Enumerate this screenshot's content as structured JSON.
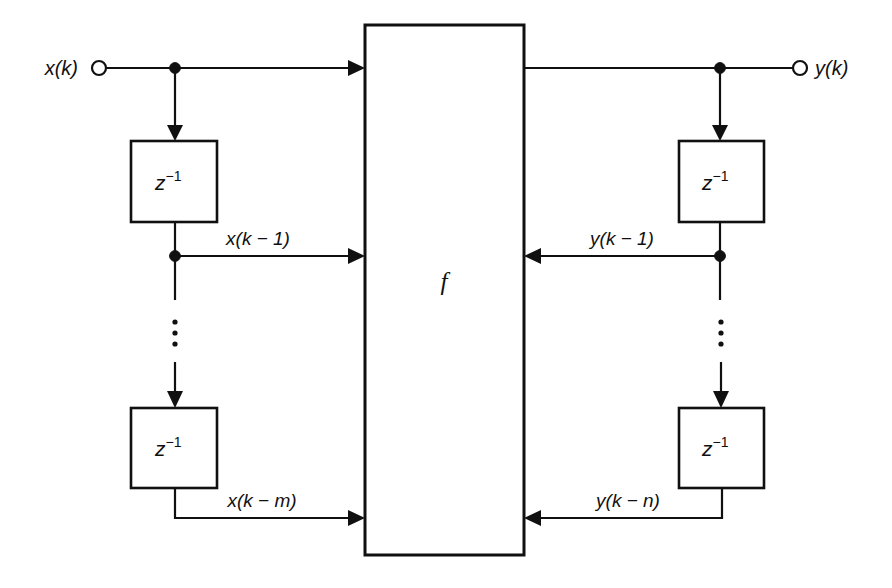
{
  "figure": {
    "background_color": "#ffffff",
    "line_color": "#101010",
    "width": 892,
    "height": 588
  },
  "central_block": {
    "label": "f",
    "name": "nonlinear-function-block"
  },
  "input_terminal": {
    "label": "x(k)",
    "marker": "open-circle"
  },
  "output_terminal": {
    "label": "y(k)",
    "marker": "open-circle"
  },
  "delay_blocks": [
    {
      "id": "x-delay-1",
      "label_base": "z",
      "label_exponent": "−1",
      "side": "input"
    },
    {
      "id": "x-delay-m",
      "label_base": "z",
      "label_exponent": "−1",
      "side": "input"
    },
    {
      "id": "y-delay-1",
      "label_base": "z",
      "label_exponent": "−1",
      "side": "output"
    },
    {
      "id": "y-delay-n",
      "label_base": "z",
      "label_exponent": "−1",
      "side": "output"
    }
  ],
  "signal_labels": {
    "x_delay_1": "x(k − 1)",
    "x_delay_m": "x(k − m)",
    "y_delay_1": "y(k − 1)",
    "y_delay_n": "y(k − n)"
  },
  "ellipsis": {
    "glyph": "⋮",
    "left_label": "vertical-ellipsis-left",
    "right_label": "vertical-ellipsis-right"
  }
}
